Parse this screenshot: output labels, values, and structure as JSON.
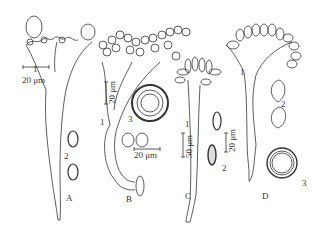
{
  "figure": {
    "panels": [
      {
        "id": "A",
        "label": "A",
        "parts": {
          "p1": "1",
          "p2": "2"
        },
        "scale": "20 μm"
      },
      {
        "id": "B",
        "label": "B",
        "parts": {
          "p1": "1",
          "p3": "3"
        },
        "scale_main": "20 μm",
        "scale_spores": "20 μm"
      },
      {
        "id": "C",
        "label": "C",
        "parts": {
          "p1": "1",
          "p2": "2"
        },
        "scale_main": "50 μm",
        "scale_spores": "20 μm"
      },
      {
        "id": "D",
        "label": "D",
        "parts": {
          "p1": "1",
          "p2": "2",
          "p3": "3"
        }
      }
    ],
    "line_color": "#333333",
    "background": "#ffffff"
  }
}
